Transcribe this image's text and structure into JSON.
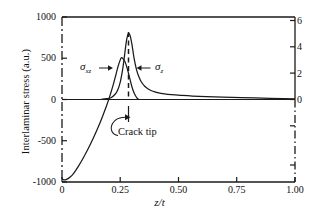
{
  "chart_data": {
    "type": "line",
    "title": "",
    "xlabel": "z/t",
    "ylabel": "Interlaminar stress (a.u.)",
    "xlim": [
      0,
      1.0
    ],
    "ylim": [
      -1000,
      1000
    ],
    "ylim_right": [
      -6,
      6
    ],
    "grid": false,
    "legend_position": "inline-annotations",
    "x_ticks": [
      "0",
      "0.25",
      "0.50",
      "0.75",
      "1.00"
    ],
    "x_tick_values": [
      0,
      0.25,
      0.5,
      0.75,
      1.0
    ],
    "y_ticks_left": [
      "1000",
      "500",
      "0",
      "-500",
      "-1000"
    ],
    "y_tick_values_left": [
      1000,
      500,
      0,
      -500,
      -1000
    ],
    "y_ticks_right": [
      "6",
      "4",
      "2",
      "0"
    ],
    "y_tick_values_right": [
      6,
      4,
      2,
      0
    ],
    "series": [
      {
        "name": "sigma_z",
        "label": "σ",
        "label_sub": "z",
        "axis": "right",
        "peak_x": 0.285,
        "peak_y": 800,
        "description": "Tall narrow peak at the crack tip decaying asymptotically to zero",
        "x": [
          0.17,
          0.19,
          0.21,
          0.23,
          0.24,
          0.25,
          0.26,
          0.265,
          0.27,
          0.275,
          0.28,
          0.285,
          0.29,
          0.295,
          0.3,
          0.305,
          0.31,
          0.32,
          0.33,
          0.34,
          0.355,
          0.37,
          0.39,
          0.41,
          0.44,
          0.47,
          0.51,
          0.56,
          0.62,
          0.69,
          0.77,
          0.86,
          0.95,
          1.0
        ],
        "y": [
          5,
          10,
          22,
          70,
          120,
          210,
          360,
          460,
          570,
          680,
          760,
          800,
          790,
          745,
          670,
          580,
          490,
          360,
          275,
          215,
          160,
          128,
          100,
          84,
          68,
          58,
          50,
          42,
          35,
          29,
          23,
          17,
          11,
          8
        ]
      },
      {
        "name": "sigma_xz",
        "label": "σ",
        "label_sub": "xz",
        "axis": "left",
        "peak_x": 0.255,
        "peak_y": 505,
        "start_value": -960,
        "description": "Rises from about -960 at z/t = 0, crosses zero near z/t = 0.20, peaks near 505 then falls back to zero by z/t = 0.33",
        "x": [
          0.0,
          0.008,
          0.02,
          0.035,
          0.05,
          0.07,
          0.09,
          0.11,
          0.13,
          0.15,
          0.165,
          0.18,
          0.19,
          0.2,
          0.21,
          0.22,
          0.23,
          0.24,
          0.25,
          0.255,
          0.26,
          0.27,
          0.28,
          0.29,
          0.3,
          0.31,
          0.32,
          0.325,
          0.33
        ],
        "y": [
          -960,
          -975,
          -968,
          -940,
          -895,
          -810,
          -715,
          -610,
          -495,
          -370,
          -270,
          -160,
          -85,
          -5,
          85,
          180,
          285,
          395,
          480,
          505,
          500,
          460,
          375,
          265,
          155,
          75,
          25,
          8,
          0
        ]
      }
    ],
    "annotations": [
      {
        "name": "crack-tip",
        "text": "Crack tip",
        "x": 0.285,
        "note": "curved arrow pointing to vertical marker at the crack-tip location"
      },
      {
        "name": "crack-tip-dashed-line",
        "text": "",
        "x": 0.285,
        "note": "vertical dashed line from axis up through the sigma_z peak"
      }
    ]
  },
  "axes": {
    "left_axis_style": "dash-dot",
    "right_axis_style": "solid above zero, dash-dot below zero",
    "top_axis_style": "solid",
    "bottom_axis_style": "solid"
  },
  "labels": {
    "sigma_xz": "σ",
    "sigma_xz_sub": "xz",
    "sigma_z": "σ",
    "sigma_z_sub": "z",
    "crack_tip": "Crack tip",
    "y_axis_title": "Interlaminar stress (a.u.)",
    "x_axis_title": "z/t"
  },
  "ticks": {
    "x": [
      {
        "label": "0"
      },
      {
        "label": "0.25"
      },
      {
        "label": "0.50"
      },
      {
        "label": "0.75"
      },
      {
        "label": "1.00"
      }
    ],
    "y_left": [
      {
        "label": "1000"
      },
      {
        "label": "500"
      },
      {
        "label": "0"
      },
      {
        "label": "-500"
      },
      {
        "label": "-1000"
      }
    ],
    "y_right": [
      {
        "label": "6"
      },
      {
        "label": "4"
      },
      {
        "label": "2"
      },
      {
        "label": "0"
      }
    ]
  },
  "colors": {
    "ink": "#1a1a1a",
    "background": "#ffffff"
  }
}
